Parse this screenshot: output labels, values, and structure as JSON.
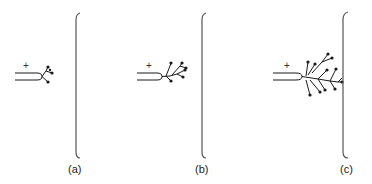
{
  "panels": [
    {
      "id": "a",
      "label": "(a)",
      "polarity": "+",
      "stage": "initial tip growth"
    },
    {
      "id": "b",
      "label": "(b)",
      "polarity": "+",
      "stage": "branching tree growth"
    },
    {
      "id": "c",
      "label": "(c)",
      "polarity": "+",
      "stage": "tree reaches opposite electrode"
    }
  ],
  "colors": {
    "stroke": "#1a1a1a",
    "electrode": "#555555",
    "background": "#ffffff"
  }
}
